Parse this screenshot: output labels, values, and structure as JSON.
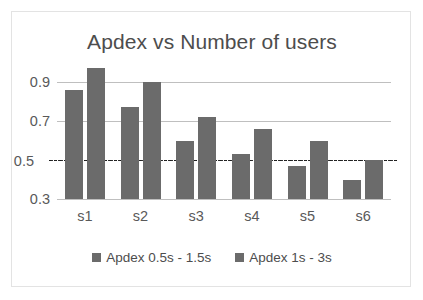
{
  "chart_data": {
    "type": "bar",
    "title": "Apdex vs Number of users",
    "xlabel": "",
    "ylabel": "",
    "categories": [
      "s1",
      "s2",
      "s3",
      "s4",
      "s5",
      "s6"
    ],
    "series": [
      {
        "name": "Apdex 0.5s - 1.5s",
        "values": [
          0.86,
          0.77,
          0.6,
          0.53,
          0.47,
          0.4
        ],
        "color": "#6b6b6b"
      },
      {
        "name": "Apdex 1s - 3s",
        "values": [
          0.97,
          0.9,
          0.72,
          0.66,
          0.6,
          0.5
        ],
        "color": "#6b6b6b"
      }
    ],
    "ylim": [
      0.3,
      0.9
    ],
    "yticks": [
      "0.9",
      "0.7",
      "0.5",
      "0.3"
    ],
    "ytick_values": [
      0.9,
      0.7,
      0.5,
      0.3
    ],
    "grid": true,
    "gridlines": [
      0.9,
      0.7,
      0.3
    ],
    "threshold": {
      "value": 0.5,
      "style": "dash-dot",
      "color": "#262626"
    },
    "legend_position": "bottom",
    "legend": [
      "Apdex 0.5s - 1.5s",
      "Apdex 1s - 3s"
    ],
    "plot_background": "#ffffff",
    "gridline_color": "#bfbfbf",
    "border_color": "#e3e3e3"
  }
}
